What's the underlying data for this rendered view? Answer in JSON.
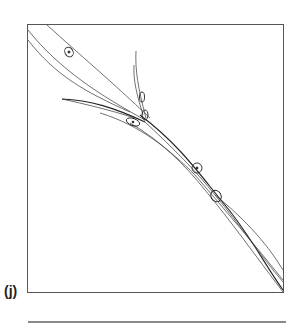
{
  "figure": {
    "panel_label": "(j)",
    "stroke_color": "#222222",
    "box_border_color": "#555555",
    "rule_color": "#8a8a8a"
  }
}
